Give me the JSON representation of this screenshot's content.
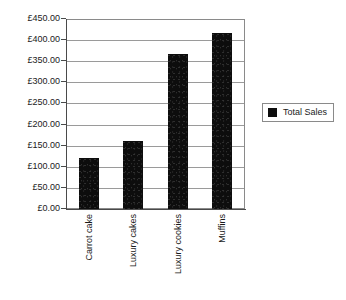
{
  "chart_data": {
    "type": "bar",
    "title": "",
    "xlabel": "",
    "ylabel": "",
    "categories": [
      "Carrot cake",
      "Luxury cakes",
      "Luxury cookies",
      "Muffins"
    ],
    "series": [
      {
        "name": "Total Sales",
        "values": [
          122,
          162,
          368,
          417
        ],
        "color": "#0d0d0d"
      }
    ],
    "ylim": [
      0,
      450
    ],
    "ytick_step": 50,
    "ytick_values": [
      0,
      50,
      100,
      150,
      200,
      250,
      300,
      350,
      400,
      450
    ],
    "ytick_labels": [
      "£0.00",
      "£50.00",
      "£100.00",
      "£150.00",
      "£200.00",
      "£250.00",
      "£300.00",
      "£350.00",
      "£400.00",
      "£450.00"
    ],
    "currency_symbol": "£",
    "grid": true,
    "grid_axis": "y",
    "legend": {
      "position": "right",
      "entries": [
        {
          "label": "Total Sales",
          "color": "#0d0d0d"
        }
      ]
    },
    "axis_color": "#4a4a4a",
    "grid_color": "#9a9a9a",
    "plot_border_color": "#8a8a8a",
    "background": "#ffffff"
  }
}
